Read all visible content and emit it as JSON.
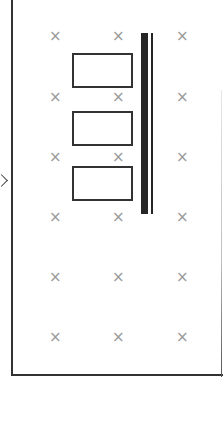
{
  "diagram": {
    "type": "layout-plan",
    "panel": {
      "left": 11,
      "top": -2,
      "width": 212,
      "height": 378,
      "border_color": "#333333"
    },
    "marker_symbol": "×",
    "marker_color": "#9a9a9a",
    "markers": {
      "columns_x": [
        55,
        118,
        182
      ],
      "rows_y": [
        36,
        97,
        157,
        217,
        277,
        337
      ]
    },
    "boxes": [
      {
        "x": 72,
        "y": 53,
        "w": 61,
        "h": 35
      },
      {
        "x": 72,
        "y": 111,
        "w": 61,
        "h": 35
      },
      {
        "x": 72,
        "y": 166,
        "w": 61,
        "h": 35
      }
    ],
    "bar_thick": {
      "x": 141,
      "y": 33,
      "w": 7,
      "h": 181,
      "color": "#262626"
    },
    "bar_thin": {
      "x": 151,
      "y": 33,
      "w": 2,
      "h": 181,
      "color": "#262626"
    },
    "edge_chevron": {
      "direction": "right",
      "y": 180
    }
  }
}
